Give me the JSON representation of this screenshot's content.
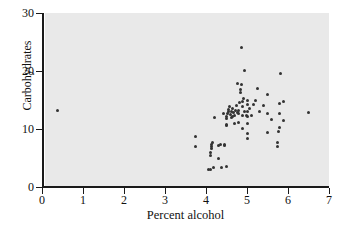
{
  "chart_data": {
    "type": "scatter",
    "title": "",
    "xlabel": "Percent alcohol",
    "ylabel": "Carbohydrates",
    "xlim": [
      0,
      7
    ],
    "ylim": [
      0,
      30
    ],
    "xticks": [
      0,
      1,
      2,
      3,
      4,
      5,
      6,
      7
    ],
    "yticks": [
      0,
      10,
      20,
      30
    ],
    "grid": false,
    "legend": null,
    "marker_color": "#333333",
    "plot_background_color": "#e9e9e9",
    "axis_color": "#1a1a1a",
    "points": [
      [
        0.38,
        13.2
      ],
      [
        3.75,
        8.7
      ],
      [
        3.74,
        7.0
      ],
      [
        4.06,
        3.0
      ],
      [
        4.12,
        3.1
      ],
      [
        4.18,
        3.3
      ],
      [
        4.12,
        5.5
      ],
      [
        4.12,
        5.9
      ],
      [
        4.14,
        6.6
      ],
      [
        4.14,
        7.0
      ],
      [
        4.14,
        7.3
      ],
      [
        4.16,
        7.6
      ],
      [
        4.2,
        12.0
      ],
      [
        4.3,
        5.0
      ],
      [
        4.3,
        7.2
      ],
      [
        4.36,
        7.3
      ],
      [
        4.37,
        3.3
      ],
      [
        4.42,
        12.6
      ],
      [
        4.45,
        7.2
      ],
      [
        4.45,
        7.4
      ],
      [
        4.5,
        3.6
      ],
      [
        4.5,
        10.6
      ],
      [
        4.5,
        10.8
      ],
      [
        4.5,
        11.8
      ],
      [
        4.5,
        12.2
      ],
      [
        4.52,
        12.6
      ],
      [
        4.55,
        13.0
      ],
      [
        4.55,
        13.4
      ],
      [
        4.58,
        13.8
      ],
      [
        4.6,
        12.5
      ],
      [
        4.62,
        11.9
      ],
      [
        4.62,
        13.1
      ],
      [
        4.65,
        12.2
      ],
      [
        4.65,
        13.6
      ],
      [
        4.68,
        12.9
      ],
      [
        4.7,
        11.0
      ],
      [
        4.7,
        12.4
      ],
      [
        4.72,
        13.2
      ],
      [
        4.74,
        14.0
      ],
      [
        4.76,
        12.8
      ],
      [
        4.78,
        17.9
      ],
      [
        4.8,
        11.1
      ],
      [
        4.8,
        12.7
      ],
      [
        4.8,
        13.2
      ],
      [
        4.82,
        14.5
      ],
      [
        4.84,
        16.3
      ],
      [
        4.85,
        16.8
      ],
      [
        4.86,
        17.6
      ],
      [
        4.86,
        24.0
      ],
      [
        4.88,
        13.8
      ],
      [
        4.9,
        10.1
      ],
      [
        4.9,
        12.3
      ],
      [
        4.9,
        14.8
      ],
      [
        4.92,
        15.3
      ],
      [
        4.95,
        13.0
      ],
      [
        4.95,
        20.1
      ],
      [
        4.98,
        12.4
      ],
      [
        5.0,
        9.2
      ],
      [
        5.0,
        11.0
      ],
      [
        5.0,
        12.2
      ],
      [
        5.0,
        13.0
      ],
      [
        5.0,
        14.3
      ],
      [
        5.0,
        14.9
      ],
      [
        5.02,
        8.4
      ],
      [
        5.05,
        13.5
      ],
      [
        5.1,
        12.4
      ],
      [
        5.15,
        14.3
      ],
      [
        5.2,
        14.9
      ],
      [
        5.25,
        17.0
      ],
      [
        5.3,
        13.0
      ],
      [
        5.4,
        14.0
      ],
      [
        5.5,
        9.4
      ],
      [
        5.5,
        12.6
      ],
      [
        5.5,
        16.0
      ],
      [
        5.6,
        11.6
      ],
      [
        5.75,
        7.0
      ],
      [
        5.75,
        7.6
      ],
      [
        5.78,
        9.5
      ],
      [
        5.8,
        10.3
      ],
      [
        5.8,
        12.7
      ],
      [
        5.8,
        14.4
      ],
      [
        5.82,
        19.6
      ],
      [
        5.88,
        11.4
      ],
      [
        5.9,
        14.7
      ],
      [
        6.5,
        12.8
      ]
    ]
  }
}
